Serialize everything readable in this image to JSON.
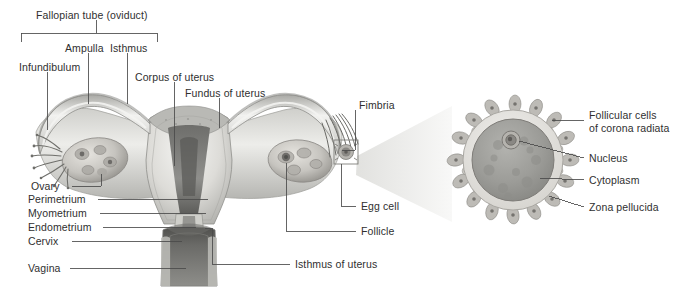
{
  "figure": {
    "background_color": "#ffffff",
    "text_color": "#2f2f2f",
    "leader_color": "#4a4a4a",
    "width": 676,
    "height": 290
  },
  "labels": {
    "fallopian_tube": "Fallopian tube (oviduct)",
    "ampulla": "Ampulla",
    "isthmus": "Isthmus",
    "infundibulum": "Infundibulum",
    "corpus_of_uterus": "Corpus of uterus",
    "fundus_of_uterus": "Fundus of uterus",
    "fimbria": "Fimbria",
    "ovary": "Ovary",
    "perimetrium": "Perimetrium",
    "myometrium": "Myometrium",
    "endometrium": "Endometrium",
    "cervix": "Cervix",
    "vagina": "Vagina",
    "egg_cell": "Egg cell",
    "follicle": "Follicle",
    "isthmus_of_uterus": "Isthmus of uterus",
    "follicular_cells": "Follicular cells\nof corona radiata",
    "nucleus": "Nucleus",
    "cytoplasm": "Cytoplasm",
    "zona_pellucida": "Zona pellucida"
  },
  "colors": {
    "tissue_light": "#e8e8e6",
    "tissue_mid": "#c9c9c6",
    "tissue_dark": "#8d8d8a",
    "cavity_dark": "#4a4a48",
    "ovum_cytoplasm": "#9a9a97",
    "zona": "#dedcd8",
    "corona": "#b4b4b0",
    "cone": "#f0f0ee"
  }
}
